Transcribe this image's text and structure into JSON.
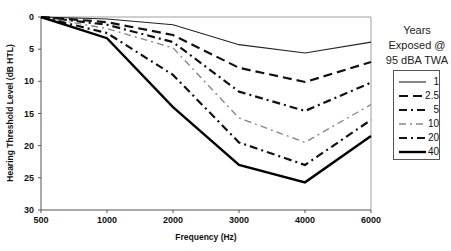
{
  "chart_data": {
    "type": "line",
    "title": "",
    "xlabel": "Frequency (Hz)",
    "ylabel": "Hearing Threshold Level (dB HTL)",
    "x": [
      500,
      1000,
      2000,
      3000,
      4000,
      6000
    ],
    "x_tick_labels": [
      "500",
      "1000",
      "2000",
      "3000",
      "4000",
      "6000"
    ],
    "y_tick_labels": [
      "0",
      "5",
      "10",
      "15",
      "20",
      "25",
      "30"
    ],
    "ylim": [
      0,
      30
    ],
    "y_inverted": true,
    "grid": false,
    "legend_title": "Years Exposed @ 95 dBA TWA",
    "legend_title_lines": [
      "Years",
      "Exposed @",
      "95 dBA TWA"
    ],
    "legend_position": "right",
    "series": [
      {
        "name": "1",
        "values": [
          0,
          0.3,
          1.2,
          4.3,
          5.6,
          3.9
        ],
        "style": "solid-thin",
        "color": "#222222"
      },
      {
        "name": "2.5",
        "values": [
          0,
          0.8,
          2.8,
          7.9,
          10.1,
          7.0
        ],
        "style": "long-dash",
        "color": "#111111"
      },
      {
        "name": "5",
        "values": [
          0,
          1.2,
          3.9,
          11.6,
          14.6,
          10.2
        ],
        "style": "dash-dot",
        "color": "#111111"
      },
      {
        "name": "10",
        "values": [
          0,
          1.8,
          4.8,
          15.7,
          19.5,
          13.6
        ],
        "style": "dash-dot-gray",
        "color": "#888888"
      },
      {
        "name": "20",
        "values": [
          0,
          2.5,
          9.0,
          19.5,
          23.0,
          16.0
        ],
        "style": "dash-dot",
        "color": "#111111"
      },
      {
        "name": "40",
        "values": [
          0,
          3.3,
          14.0,
          23.0,
          25.7,
          18.5
        ],
        "style": "solid-thick",
        "color": "#000000"
      }
    ]
  }
}
